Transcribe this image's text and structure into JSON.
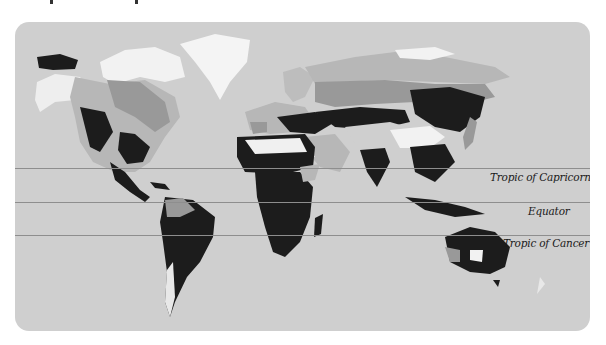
{
  "map": {
    "title": "World climate zones map",
    "colors": {
      "ocean": "#cfcfcf",
      "ice": "#f4f4f4",
      "dark_zone": "#1c1c1c",
      "mid_zone": "#999999",
      "light_zone": "#b7b7b7",
      "desert": "#f0f0f0",
      "lat_line": "#8e8e8e"
    },
    "latitude_lines": [
      {
        "label": "Tropic of Capricorn",
        "y": 146
      },
      {
        "label": "Equator",
        "y": 180
      },
      {
        "label": "Tropic of Cancer",
        "y": 213
      }
    ]
  }
}
